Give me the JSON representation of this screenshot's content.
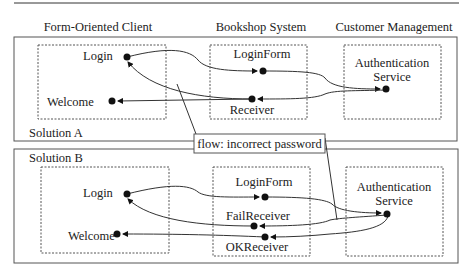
{
  "columns": {
    "client": "Form-Oriented Client",
    "system": "Bookshop System",
    "customer": "Customer Management"
  },
  "solution_a": {
    "title": "Solution A",
    "client_nodes": [
      "Login",
      "Welcome"
    ],
    "system_nodes": [
      "LoginForm",
      "Receiver"
    ],
    "service": {
      "line1": "Authentication",
      "line2": "Service"
    }
  },
  "solution_b": {
    "title": "Solution B",
    "client_nodes": [
      "Login",
      "Welcome"
    ],
    "system_nodes": [
      "LoginForm",
      "FailReceiver",
      "OKReceiver"
    ],
    "service": {
      "line1": "Authentication",
      "line2": "Service"
    }
  },
  "callout": {
    "label": "flow: incorrect password"
  },
  "colors": {
    "line": "#333333",
    "frame": "#555555",
    "background": "#ffffff"
  }
}
